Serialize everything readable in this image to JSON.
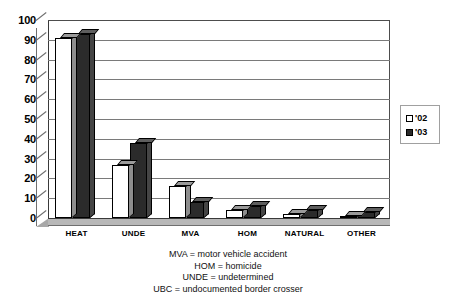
{
  "chart_data": {
    "type": "bar",
    "title": "",
    "subtitle": "",
    "xlabel": "",
    "ylabel": "",
    "ylim": [
      0,
      100
    ],
    "ytick_step": 10,
    "yticks": [
      100,
      90,
      80,
      70,
      60,
      50,
      40,
      30,
      20,
      10,
      0
    ],
    "grid": true,
    "grid_axis": "y",
    "style": "3d-column",
    "legend_position": "right",
    "categories": [
      "HEAT",
      "UNDE",
      "MVA",
      "HOM",
      "NATURAL",
      "OTHER"
    ],
    "series": [
      {
        "name": "'02",
        "color": "#ffffff",
        "values": [
          91,
          27,
          16,
          4,
          2,
          1
        ]
      },
      {
        "name": "'03",
        "color": "#2b2b2b",
        "values": [
          93,
          38,
          8,
          6,
          4,
          3
        ]
      }
    ],
    "annotations": [
      "MVA = motor vehicle accident",
      "HOM = homicide",
      "UNDE = undetermined",
      "UBC = undocumented border crosser"
    ]
  },
  "legend": {
    "entries": [
      {
        "label": "'02",
        "marker": "hollow-square-icon"
      },
      {
        "label": "'03",
        "marker": "filled-square-icon"
      }
    ]
  },
  "colors": {
    "background": "#ffffff",
    "gridline": "#7a7a7a",
    "axis": "#3a3a3a",
    "series_02": "#ffffff",
    "series_03": "#2b2b2b",
    "floor": "#b8b8b8",
    "text": "#000000"
  }
}
